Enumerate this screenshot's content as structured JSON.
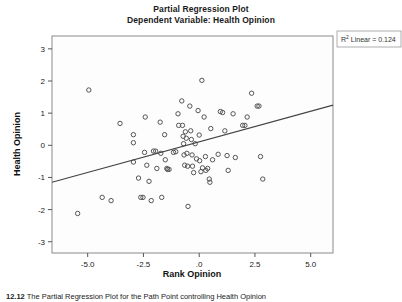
{
  "figure": {
    "title_line1": "Partial Regression Plot",
    "title_line2": "Dependent Variable: Health Opinion",
    "r2_prefix": "R",
    "r2_sup": "2",
    "r2_text": " Linear = 0.124",
    "caption_label": "12.12",
    "caption_text": "The Partial Regression Plot for the Path Point controlling Health Opinion"
  },
  "chart_data": {
    "type": "scatter",
    "title": "Partial Regression Plot\nDependent Variable: Health Opinion",
    "xlabel": "Rank Opinion",
    "ylabel": "Health Opinion",
    "xlim": [
      -6.6,
      6.0
    ],
    "ylim": [
      -3.35,
      3.4
    ],
    "xticks": [
      -5.0,
      -2.5,
      0.0,
      2.5,
      5.0
    ],
    "xticklabels": [
      "-5.0",
      "-2.5",
      ".0",
      "2.5",
      "5.0"
    ],
    "yticks": [
      -3,
      -2,
      -1,
      0,
      1,
      2,
      3
    ],
    "yticklabels": [
      "-3",
      "-2",
      "-1",
      "0",
      "1",
      "2",
      "3"
    ],
    "grid": false,
    "legend": false,
    "annotation": "R² Linear = 0.124",
    "r_squared": 0.124,
    "marker": "open-circle",
    "marker_color": "#555555",
    "fit_line": {
      "type": "linear",
      "color": "#444444",
      "x_start": -6.6,
      "y_start": -1.15,
      "x_end": 6.0,
      "y_end": 1.25,
      "slope": 0.19,
      "intercept": 0.105
    },
    "points": [
      [
        -4.95,
        1.72
      ],
      [
        -5.45,
        -2.12
      ],
      [
        -4.35,
        -1.62
      ],
      [
        -3.55,
        0.68
      ],
      [
        -3.95,
        -1.72
      ],
      [
        -2.95,
        0.33
      ],
      [
        -2.95,
        0.08
      ],
      [
        -2.95,
        -0.52
      ],
      [
        -2.72,
        -1.02
      ],
      [
        -2.62,
        -1.62
      ],
      [
        -2.52,
        -1.62
      ],
      [
        -2.45,
        -0.22
      ],
      [
        -2.42,
        0.88
      ],
      [
        -2.35,
        -0.62
      ],
      [
        -2.25,
        -1.12
      ],
      [
        -2.15,
        -1.72
      ],
      [
        -2.05,
        -0.18
      ],
      [
        -1.95,
        -0.18
      ],
      [
        -1.9,
        -0.72
      ],
      [
        -1.75,
        0.72
      ],
      [
        -1.72,
        -0.25
      ],
      [
        -1.68,
        -1.62
      ],
      [
        -1.55,
        0.33
      ],
      [
        -1.52,
        -0.45
      ],
      [
        -1.45,
        -0.72
      ],
      [
        -1.42,
        -0.75
      ],
      [
        -1.35,
        -0.75
      ],
      [
        -1.15,
        -0.22
      ],
      [
        -1.05,
        -0.2
      ],
      [
        -0.95,
        0.98
      ],
      [
        -0.92,
        0.62
      ],
      [
        -0.78,
        1.38
      ],
      [
        -0.75,
        0.62
      ],
      [
        -0.72,
        0.28
      ],
      [
        -0.7,
        0.05
      ],
      [
        -0.68,
        -0.3
      ],
      [
        -0.65,
        -0.62
      ],
      [
        -0.62,
        0.42
      ],
      [
        -0.58,
        0.22
      ],
      [
        -0.55,
        -0.25
      ],
      [
        -0.52,
        -0.65
      ],
      [
        -0.5,
        -1.9
      ],
      [
        -0.42,
        1.22
      ],
      [
        -0.38,
        0.45
      ],
      [
        -0.35,
        0.18
      ],
      [
        -0.32,
        -0.3
      ],
      [
        -0.3,
        -0.65
      ],
      [
        -0.25,
        -0.85
      ],
      [
        -0.18,
        0.05
      ],
      [
        -0.12,
        -0.42
      ],
      [
        -0.05,
        1.08
      ],
      [
        0.0,
        0.32
      ],
      [
        0.02,
        -0.48
      ],
      [
        0.08,
        -0.82
      ],
      [
        0.12,
        2.02
      ],
      [
        0.15,
        -0.7
      ],
      [
        0.22,
        0.88
      ],
      [
        0.28,
        -0.35
      ],
      [
        0.3,
        -0.78
      ],
      [
        0.38,
        -0.72
      ],
      [
        0.45,
        -1.05
      ],
      [
        0.48,
        -1.15
      ],
      [
        0.52,
        0.52
      ],
      [
        0.6,
        -0.45
      ],
      [
        0.85,
        -0.28
      ],
      [
        0.95,
        1.05
      ],
      [
        1.05,
        1.02
      ],
      [
        1.15,
        0.45
      ],
      [
        1.25,
        -0.32
      ],
      [
        1.3,
        -0.78
      ],
      [
        1.52,
        0.98
      ],
      [
        1.62,
        -0.38
      ],
      [
        1.95,
        0.62
      ],
      [
        2.05,
        0.62
      ],
      [
        2.15,
        0.88
      ],
      [
        2.35,
        1.62
      ],
      [
        2.6,
        1.22
      ],
      [
        2.68,
        1.22
      ],
      [
        2.75,
        -0.35
      ],
      [
        2.85,
        -1.05
      ]
    ]
  }
}
